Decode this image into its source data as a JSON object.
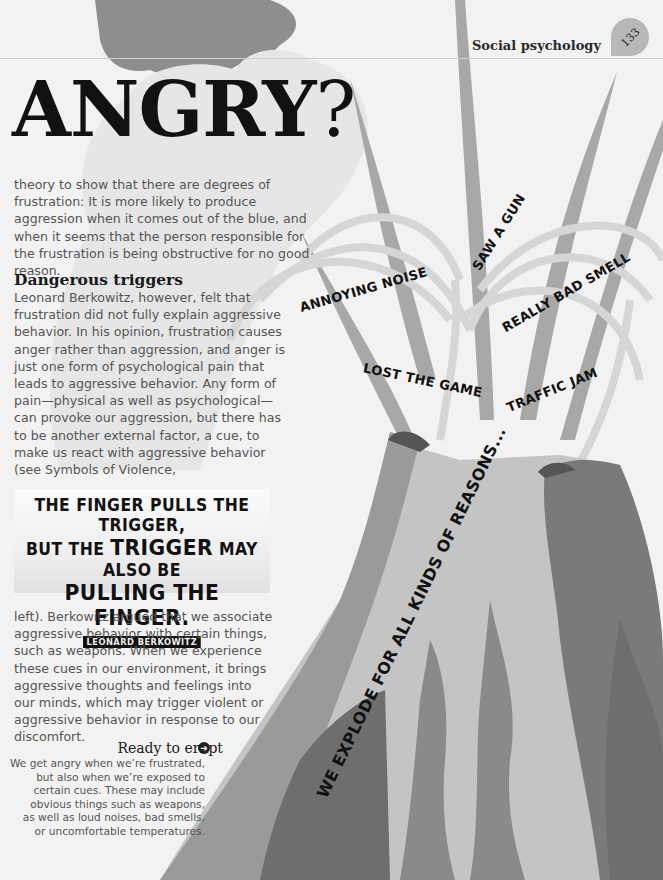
{
  "header": {
    "section": "Social psychology",
    "page_number": "133"
  },
  "headline": {
    "word": "ANGRY",
    "punct": "?"
  },
  "intro_paragraph": "theory to show that there are degrees of frustration: It is more likely to produce aggression when it comes out of the blue, and when it seems that the person responsible for the frustration is being obstructive for no good reason.",
  "section_heading": "Dangerous triggers",
  "section_paragraph_1": "Leonard Berkowitz, however, felt that frustration did not fully explain aggressive behavior. In his opinion, frustration causes anger rather than aggression, and anger is just one form of psychological pain that leads to aggressive behavior. Any form of pain—physical as well as psychological—can provoke our aggression, but there has to be another external factor, a cue, to make us react with aggressive behavior (see Symbols of Violence,",
  "quote": {
    "line1": "THE FINGER PULLS THE TRIGGER,",
    "line2_pre": "BUT THE ",
    "line2_big": "TRIGGER",
    "line2_post": " MAY ALSO BE",
    "line3": "PULLING THE FINGER.",
    "attribution": "LEONARD BERKOWITZ"
  },
  "section_paragraph_2": "left). Berkowitz argued that we associate aggressive behavior with certain things, such as weapons. When we experience these cues in our environment, it brings aggressive thoughts and feelings into our minds, which may trigger violent or aggressive behavior in response to our discomfort.",
  "callout": {
    "title": "Ready to erupt",
    "icon": "arrow-right-circle-icon",
    "text": "We get angry when we’re frustrated,\nbut also when we’re exposed to\ncertain cues. These may include\nobvious things such as weapons,\nas well as loud noises, bad smells,\nor uncomfortable temperatures."
  },
  "illustration": {
    "labels": [
      "ANNOYING NOISE",
      "SAW A GUN",
      "REALLY BAD SMELL",
      "LOST THE GAME",
      "TRAFFIC JAM"
    ],
    "slogan": "WE EXPLODE FOR ALL KINDS OF REASONS..."
  },
  "colors": {
    "background": "#f2f2f2",
    "cloud_dark": "#8e8e8e",
    "cloud_light": "#e6e6e6",
    "volcano_light": "#c4c4c4",
    "volcano_mid": "#9a9a9a",
    "volcano_dark": "#6e6e6e",
    "text_body": "#555555",
    "text_dark": "#111111"
  }
}
